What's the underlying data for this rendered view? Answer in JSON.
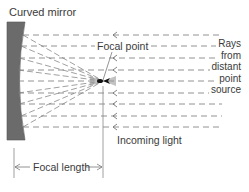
{
  "diagram": {
    "title_label": "Curved mirror",
    "focal_point_label": "Focal point",
    "incoming_light_label": "Incoming light",
    "focal_length_label": "Focal length",
    "source_label_lines": [
      "Rays",
      "from",
      "distant",
      "point",
      "source"
    ],
    "ray_count": 9,
    "ray_y_positions": [
      35,
      46,
      58,
      70,
      81,
      93,
      104,
      116,
      127
    ],
    "focal_point_position": {
      "x": 103,
      "y": 81
    },
    "mirror": {
      "x_left": 7,
      "top": 22,
      "bottom": 140
    },
    "focal_length_span": {
      "x_start": 14,
      "x_end": 103
    },
    "colors": {
      "mirror_fill": "#6b6b6b",
      "line": "#6a6a6a",
      "text": "#3a3a3a",
      "background": "#ffffff"
    }
  }
}
